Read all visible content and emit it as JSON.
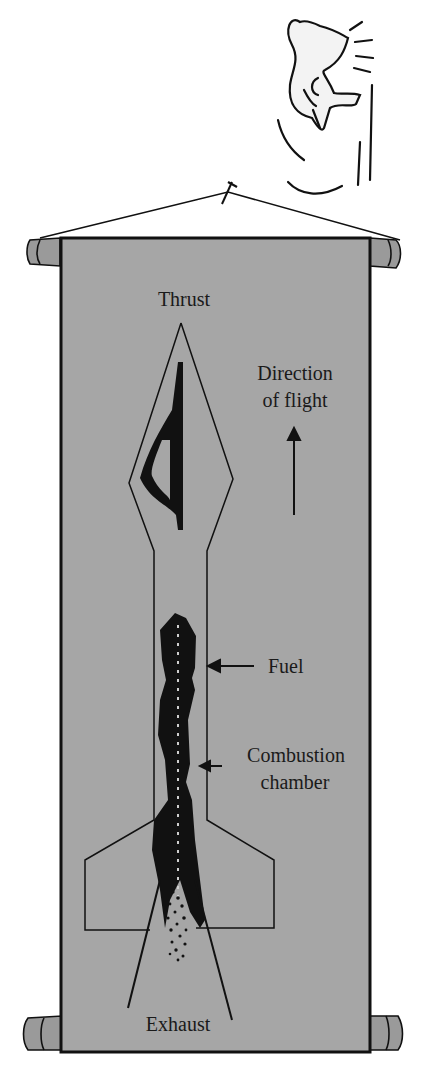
{
  "diagram": {
    "type": "rocket-cross-section-on-hanging-scroll",
    "colors": {
      "scroll_fill": "#a6a6a6",
      "outline": "#111111",
      "background": "#ffffff"
    },
    "labels": {
      "thrust": "Thrust",
      "direction_line1": "Direction",
      "direction_line2": "of flight",
      "fuel": "Fuel",
      "combustion_line1": "Combustion",
      "combustion_line2": "chamber",
      "exhaust": "Exhaust"
    },
    "icons": {
      "cartoon": "cartoon-face-icon",
      "arrow_up": "arrow-up-icon",
      "arrow_left": "arrow-left-icon"
    }
  }
}
